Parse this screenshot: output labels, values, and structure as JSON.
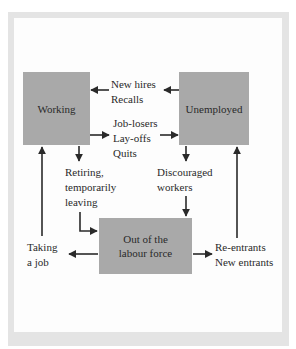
{
  "diagram": {
    "nodes": {
      "working": "Working",
      "unemployed": "Unemployed",
      "out_of_labour_force": [
        "Out of the",
        "labour force"
      ]
    },
    "flows": {
      "unemployed_to_working": [
        "New hires",
        "Recalls"
      ],
      "working_to_unemployed": [
        "Job-losers",
        "Lay-offs",
        "Quits"
      ],
      "working_to_out": [
        "Retiring,",
        "temporarily",
        "leaving"
      ],
      "unemployed_to_out": [
        "Discouraged",
        "workers"
      ],
      "out_to_working": [
        "Taking",
        "a job"
      ],
      "out_to_unemployed": [
        "Re-entrants",
        "New entrants"
      ]
    },
    "colors": {
      "box_fill": "#a9a9a9",
      "frame": "#e4e4e4",
      "arrow": "#2a2a2a"
    }
  }
}
